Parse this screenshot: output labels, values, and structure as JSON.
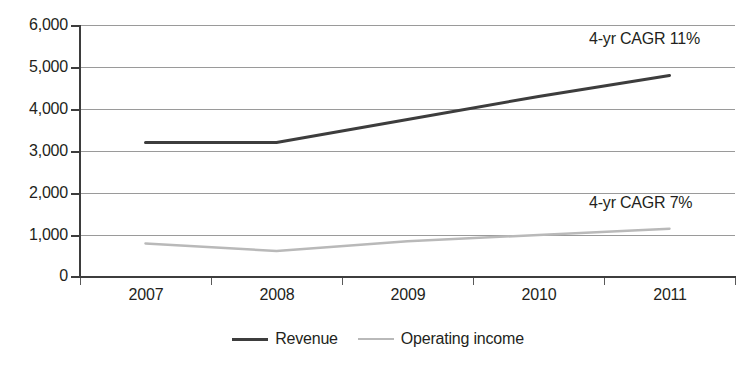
{
  "chart_data": {
    "type": "line",
    "title": "",
    "subtitle": "",
    "xlabel": "",
    "ylabel": "",
    "categories": [
      "2007",
      "2008",
      "2009",
      "2010",
      "2011"
    ],
    "series": [
      {
        "name": "Revenue",
        "color": "#3d3d3d",
        "values": [
          3200,
          3200,
          3750,
          4300,
          4800
        ]
      },
      {
        "name": "Operating income",
        "color": "#b9b9b9",
        "values": [
          800,
          620,
          850,
          1000,
          1150
        ]
      }
    ],
    "ylim": [
      0,
      6000
    ],
    "yticks": [
      0,
      1000,
      2000,
      3000,
      4000,
      5000,
      6000
    ],
    "ytick_labels": [
      "0",
      "1,000",
      "2,000",
      "3,000",
      "4,000",
      "5,000",
      "6,000"
    ],
    "grid": true,
    "grid_axis": "y",
    "legend_position": "bottom-center",
    "annotations": [
      {
        "id": "revenue-cagr",
        "text": "4-yr CAGR 11%",
        "series": "Revenue"
      },
      {
        "id": "operating-cagr",
        "text": "4-yr CAGR 7%",
        "series": "Operating income"
      }
    ]
  },
  "axes": {
    "y": {
      "ticks": [
        {
          "value": 6000,
          "label": "6,000"
        },
        {
          "value": 5000,
          "label": "5,000"
        },
        {
          "value": 4000,
          "label": "4,000"
        },
        {
          "value": 3000,
          "label": "3,000"
        },
        {
          "value": 2000,
          "label": "2,000"
        },
        {
          "value": 1000,
          "label": "1,000"
        },
        {
          "value": 0,
          "label": "0"
        }
      ]
    },
    "x": {
      "ticks": [
        {
          "label": "2007"
        },
        {
          "label": "2008"
        },
        {
          "label": "2009"
        },
        {
          "label": "2010"
        },
        {
          "label": "2011"
        }
      ]
    }
  },
  "legend": {
    "items": [
      {
        "label": "Revenue",
        "color": "#3d3d3d"
      },
      {
        "label": "Operating income",
        "color": "#b9b9b9"
      }
    ]
  },
  "colors": {
    "revenue_line": "#3d3d3d",
    "operating_income_line": "#b9b9b9",
    "gridline": "#9a9a9a",
    "axis": "#3d3d3d",
    "text": "#231f20",
    "background": "#ffffff"
  }
}
